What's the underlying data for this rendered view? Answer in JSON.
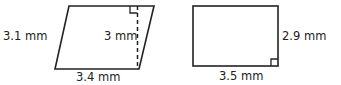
{
  "shapes": {
    "parallelogram": {
      "side_label": "3.1 mm",
      "height_label": "3 mm",
      "base_label": "3.4 mm"
    },
    "rectangle": {
      "side_label": "2.9 mm",
      "base_label": "3.5 mm"
    }
  },
  "colors": {
    "stroke": "#222222",
    "text": "#222222"
  }
}
